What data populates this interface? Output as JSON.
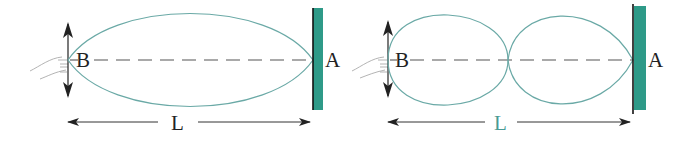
{
  "colors": {
    "wave": "#6aa9a6",
    "wall": "#2e9a88",
    "ink": "#222222",
    "dash": "#555555",
    "teal_label": "#4a9a94"
  },
  "diagrams": [
    {
      "name": "fundamental",
      "loops": 1,
      "end_label_left": "B",
      "end_label_right": "A",
      "length_label": "L",
      "length_label_color": "ink"
    },
    {
      "name": "second-harmonic",
      "loops": 2,
      "end_label_left": "B",
      "end_label_right": "A",
      "length_label": "L",
      "length_label_color": "teal_label"
    }
  ]
}
